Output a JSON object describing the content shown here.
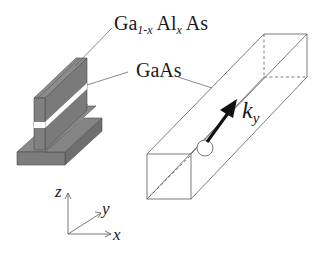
{
  "figure": {
    "labels": {
      "barrier_main": "Ga",
      "barrier_sub1": "1-x",
      "barrier_mid": " Al",
      "barrier_sub2": "x",
      "barrier_end": " As",
      "well": "GaAs",
      "wavevector_main": "k",
      "wavevector_sub": "y"
    },
    "axes": {
      "z": "z",
      "y": "y",
      "x": "x"
    },
    "colors": {
      "semiconductor_fill": "#7a7a7a",
      "semiconductor_edge": "#4a4a4a",
      "gaas_layer": "#ffffff",
      "line": "#555555",
      "arrow": "#111111"
    }
  }
}
